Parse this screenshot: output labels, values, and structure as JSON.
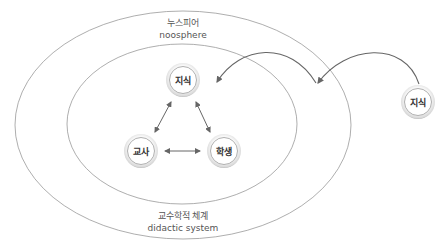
{
  "outer_ellipse": {
    "label_ko": "누스피어",
    "label_en": "noosphere"
  },
  "inner_ellipse": {
    "label_ko": "교수학적 체계",
    "label_en": "didactic system"
  },
  "nodes": {
    "knowledge_inner": "지식",
    "teacher": "교사",
    "student": "학생",
    "knowledge_outer": "지식"
  },
  "colors": {
    "line": "#888888",
    "arrow": "#666666",
    "text": "#555555"
  }
}
